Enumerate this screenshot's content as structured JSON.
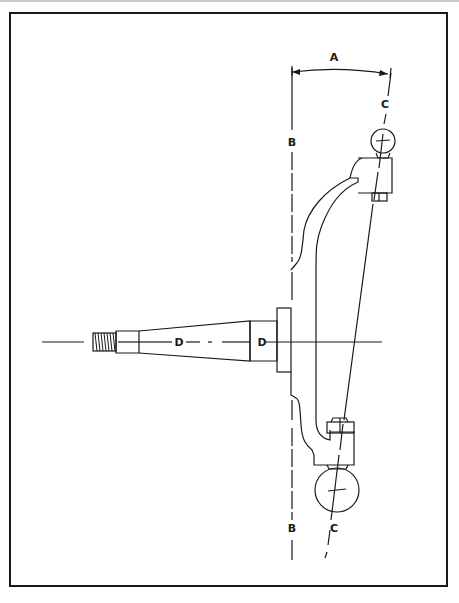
{
  "diagram": {
    "type": "technical-illustration",
    "labels": {
      "a": "A",
      "b_top": "B",
      "b_bottom": "B",
      "c_top": "C",
      "c_bottom": "C",
      "d_left": "D",
      "d_right": "D"
    },
    "label_meanings_visible": {
      "A": "angle between vertical line B and steering axis C",
      "B": "true vertical reference line",
      "C": "steering axis through ball joints",
      "D": "spindle centerline"
    },
    "colors": {
      "ink": "#1a1a1a",
      "background": "#ffffff",
      "frame": "#1a1a1a"
    }
  }
}
